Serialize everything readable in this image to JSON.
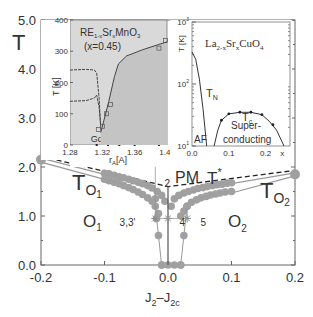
{
  "chart_data": [
    {
      "type": "scatter",
      "title": "",
      "xlabel": "J2-J2c",
      "ylabel": "T",
      "xlim": [
        -0.2,
        0.2
      ],
      "ylim": [
        0.0,
        5.0
      ],
      "xticks": [
        "-0.2",
        "-0.1",
        "0.0",
        "0.1",
        "0.2"
      ],
      "xtick_values": [
        -0.2,
        -0.1,
        0.0,
        0.1,
        0.2
      ],
      "yticks": [
        "0.0",
        "1.0",
        "2.0",
        "3.0",
        "4.0",
        "5.0"
      ],
      "ytick_values": [
        0,
        1,
        2,
        3,
        4,
        5
      ],
      "region_labels": [
        {
          "text": "PM",
          "x": 0.04,
          "y": 2.6
        },
        {
          "text": "O1",
          "x": -0.145,
          "y": 0.95
        },
        {
          "text": "O2",
          "x": 0.105,
          "y": 0.95
        },
        {
          "text": "TO1",
          "x": -0.16,
          "y": 1.75
        },
        {
          "text": "TO2",
          "x": 0.155,
          "y": 1.75
        },
        {
          "text": "T*",
          "x": 0.095,
          "y": 2.55
        }
      ],
      "point_labels": [
        {
          "text": "1",
          "x": -0.02,
          "y": 2.45
        },
        {
          "text": "2",
          "x": -0.012,
          "y": 1.75
        },
        {
          "text": "3,3'",
          "x": -0.045,
          "y": 0.95
        },
        {
          "text": "4",
          "x": 0.012,
          "y": 0.95
        },
        {
          "text": "5",
          "x": 0.045,
          "y": 0.95
        }
      ],
      "series": [
        {
          "name": "T* (dashed)",
          "style": "dashed",
          "points": [
            [
              -0.2,
              2.22
            ],
            [
              0.0,
              1.6
            ],
            [
              0.2,
              1.93
            ]
          ]
        },
        {
          "name": "TO1 upper line",
          "style": "solid-gray",
          "points": [
            [
              -0.2,
              2.18
            ],
            [
              -0.1,
              1.85
            ]
          ]
        },
        {
          "name": "TO1 lower line",
          "style": "solid-gray",
          "points": [
            [
              -0.2,
              2.1
            ],
            [
              -0.1,
              1.75
            ]
          ]
        },
        {
          "name": "TO2 upper line",
          "style": "solid-gray",
          "points": [
            [
              0.1,
              1.66
            ],
            [
              0.2,
              1.88
            ]
          ]
        },
        {
          "name": "TO2 lower line",
          "style": "solid-gray",
          "points": [
            [
              0.1,
              1.47
            ],
            [
              0.2,
              1.82
            ]
          ]
        },
        {
          "name": "upper dots left",
          "style": "dots",
          "points": [
            [
              -0.1,
              1.87
            ],
            [
              -0.093,
              1.86
            ],
            [
              -0.085,
              1.83
            ],
            [
              -0.077,
              1.8
            ],
            [
              -0.07,
              1.78
            ],
            [
              -0.062,
              1.75
            ],
            [
              -0.055,
              1.72
            ],
            [
              -0.047,
              1.69
            ],
            [
              -0.04,
              1.66
            ],
            [
              -0.032,
              1.62
            ],
            [
              -0.025,
              1.57
            ],
            [
              -0.017,
              1.5
            ],
            [
              -0.01,
              1.42
            ],
            [
              -0.005,
              1.3
            ]
          ]
        },
        {
          "name": "lower dots left",
          "style": "dots",
          "points": [
            [
              -0.1,
              1.75
            ],
            [
              -0.093,
              1.72
            ],
            [
              -0.085,
              1.69
            ],
            [
              -0.077,
              1.66
            ],
            [
              -0.07,
              1.62
            ],
            [
              -0.062,
              1.58
            ],
            [
              -0.055,
              1.54
            ],
            [
              -0.047,
              1.49
            ],
            [
              -0.04,
              1.44
            ],
            [
              -0.032,
              1.37
            ],
            [
              -0.025,
              1.3
            ],
            [
              -0.02,
              1.2
            ],
            [
              -0.015,
              1.05
            ]
          ]
        },
        {
          "name": "upper dots right",
          "style": "dots",
          "points": [
            [
              0.005,
              1.2
            ],
            [
              0.01,
              1.35
            ],
            [
              0.017,
              1.42
            ],
            [
              0.025,
              1.47
            ],
            [
              0.032,
              1.5
            ],
            [
              0.04,
              1.53
            ],
            [
              0.047,
              1.56
            ],
            [
              0.055,
              1.58
            ],
            [
              0.062,
              1.6
            ],
            [
              0.07,
              1.62
            ],
            [
              0.077,
              1.64
            ],
            [
              0.085,
              1.65
            ],
            [
              0.093,
              1.67
            ],
            [
              0.1,
              1.68
            ]
          ]
        },
        {
          "name": "lower dots right",
          "style": "dots",
          "points": [
            [
              0.02,
              1.0
            ],
            [
              0.025,
              1.1
            ],
            [
              0.03,
              1.2
            ],
            [
              0.037,
              1.28
            ],
            [
              0.045,
              1.33
            ],
            [
              0.052,
              1.37
            ],
            [
              0.06,
              1.4
            ],
            [
              0.067,
              1.43
            ],
            [
              0.075,
              1.45
            ],
            [
              0.082,
              1.47
            ],
            [
              0.09,
              1.49
            ],
            [
              0.1,
              1.5
            ]
          ]
        },
        {
          "name": "end points",
          "style": "dots-large",
          "points": [
            [
              -0.2,
              2.15
            ],
            [
              0.2,
              1.85
            ]
          ]
        },
        {
          "name": "left drop",
          "style": "dots-line",
          "points": [
            [
              -0.02,
              1.35
            ],
            [
              -0.018,
              0.95
            ],
            [
              -0.015,
              0.6
            ],
            [
              -0.01,
              0.0
            ]
          ]
        },
        {
          "name": "right drop",
          "style": "dots-line",
          "points": [
            [
              0.03,
              1.2
            ],
            [
              0.025,
              0.6
            ],
            [
              0.02,
              0.0
            ]
          ]
        },
        {
          "name": "bottom dots",
          "style": "dots",
          "points": [
            [
              -0.01,
              0.0
            ],
            [
              0.0,
              0.0
            ],
            [
              0.01,
              0.0
            ],
            [
              0.02,
              0.0
            ]
          ]
        },
        {
          "name": "center vertical line",
          "style": "solid-dark",
          "points": [
            [
              0.0,
              0.0
            ],
            [
              0.0,
              1.6
            ]
          ]
        },
        {
          "name": "stars",
          "style": "stars",
          "points": [
            [
              -0.02,
              2.45
            ],
            [
              -0.02,
              0.95
            ],
            [
              0.0,
              0.95
            ],
            [
              0.03,
              0.95
            ]
          ]
        },
        {
          "name": "star connectors",
          "style": "thin",
          "points": [
            [
              -0.02,
              0.95
            ],
            [
              0.03,
              0.95
            ]
          ]
        }
      ]
    },
    {
      "type": "line",
      "title": "RE1-xSrxMnO3 (x=0.45)",
      "title_line1": "RE",
      "title_sub1": "1-x",
      "title_mid": "Sr",
      "title_sub2": "x",
      "title_end": "MnO",
      "title_sub3": "3",
      "title_line2": "(x=0.45)",
      "xlabel": "rA[A]",
      "xlabel_main": "r",
      "xlabel_sub": "A",
      "xlabel_unit": "[A]",
      "ylabel": "T [K]",
      "xlim": [
        1.28,
        1.4
      ],
      "ylim": [
        0,
        400
      ],
      "xticks": [
        "1.28",
        "1.32",
        "1.36",
        "1.40"
      ],
      "xtick_values": [
        1.28,
        1.32,
        1.36,
        1.4
      ],
      "yticks": [
        "0",
        "100",
        "200",
        "300",
        "400"
      ],
      "ytick_values": [
        0,
        100,
        200,
        300,
        400
      ],
      "element_labels": [
        {
          "text": "Gd",
          "x": 1.313
        },
        {
          "text": "Sm",
          "x": 1.327
        },
        {
          "text": "Nd",
          "x": 1.341
        },
        {
          "text": "Pr",
          "x": 1.36
        },
        {
          "text": "La",
          "x": 1.39
        }
      ],
      "series": [
        {
          "name": "upper transition",
          "points": [
            [
              1.28,
              240
            ],
            [
              1.3,
              242
            ],
            [
              1.31,
              240
            ],
            [
              1.313,
              230
            ],
            [
              1.316,
              150
            ],
            [
              1.318,
              60
            ]
          ]
        },
        {
          "name": "lower transition",
          "points": [
            [
              1.28,
              140
            ],
            [
              1.3,
              142
            ],
            [
              1.31,
              150
            ],
            [
              1.313,
              160
            ],
            [
              1.316,
              120
            ],
            [
              1.318,
              60
            ]
          ]
        },
        {
          "name": "rising curve",
          "points": [
            [
              1.318,
              40
            ],
            [
              1.322,
              80
            ],
            [
              1.328,
              140
            ],
            [
              1.335,
              220
            ],
            [
              1.34,
              260
            ],
            [
              1.35,
              285
            ],
            [
              1.37,
              305
            ],
            [
              1.39,
              322
            ],
            [
              1.4,
              330
            ]
          ]
        }
      ],
      "markers": [
        [
          1.315,
          50
        ],
        [
          1.32,
          60
        ],
        [
          1.325,
          100
        ],
        [
          1.33,
          130
        ],
        [
          1.39,
          310
        ],
        [
          1.398,
          335
        ]
      ]
    },
    {
      "type": "line",
      "title": "La2-xSrxCuO4",
      "title_a": "La",
      "title_sub1": "2-x",
      "title_b": "Sr",
      "title_sub2": "x",
      "title_c": "CuO",
      "title_sub3": "4",
      "xlabel": "x",
      "ylabel": "T [K]",
      "yscale": "log",
      "xlim": [
        0.0,
        0.25
      ],
      "ylim": [
        10,
        1000
      ],
      "xticks": [
        "0.0",
        "0.1",
        "0.2",
        "x"
      ],
      "xtick_values": [
        0.0,
        0.1,
        0.2,
        0.245
      ],
      "yticks_base": "10",
      "yticks_exp": [
        "1",
        "2",
        "3"
      ],
      "region_labels": [
        {
          "text": "AF"
        },
        {
          "text": "Super-"
        },
        {
          "text": "conducting"
        },
        {
          "text": "TN"
        },
        {
          "text": "Tc"
        }
      ],
      "series": [
        {
          "name": "TN",
          "points": [
            [
              0.0,
              330
            ],
            [
              0.01,
              250
            ],
            [
              0.02,
              120
            ],
            [
              0.03,
              40
            ],
            [
              0.04,
              10
            ]
          ]
        },
        {
          "name": "Tc",
          "points": [
            [
              0.06,
              10
            ],
            [
              0.07,
              18
            ],
            [
              0.08,
              26
            ],
            [
              0.1,
              33
            ],
            [
              0.13,
              35
            ],
            [
              0.16,
              35
            ],
            [
              0.19,
              32
            ],
            [
              0.21,
              25
            ],
            [
              0.23,
              18
            ],
            [
              0.25,
              10
            ]
          ]
        }
      ],
      "markers": [
        [
          0.08,
          26
        ],
        [
          0.1,
          33
        ],
        [
          0.13,
          35
        ],
        [
          0.16,
          35
        ],
        [
          0.19,
          32
        ],
        [
          0.22,
          22
        ]
      ]
    }
  ],
  "labels": {
    "main_ylabel": "T",
    "main_xlabel_a": "J",
    "main_xlabel_sub_a": "2",
    "main_xlabel_dash": "–",
    "main_xlabel_b": "J",
    "main_xlabel_sub_b": "2c",
    "o1_main": "O",
    "o1_sub": "1",
    "o2_main": "O",
    "o2_sub": "2",
    "to1_main": "T",
    "to1_sub": "O",
    "to1_subsub": "1",
    "to2_main": "T",
    "to2_sub": "O",
    "to2_subsub": "2",
    "pm": "PM",
    "tstar_main": "T",
    "tstar_sup": "*",
    "tn_main": "T",
    "tn_sub": "N",
    "tc_main": "T",
    "tc_sub": "c"
  },
  "colors": {
    "dots": "#a0a0a0",
    "axis": "#555555",
    "inset_fill": "#d8d8d8",
    "text": "#333333"
  }
}
